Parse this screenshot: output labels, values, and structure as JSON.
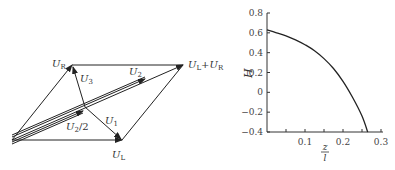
{
  "diagram": {
    "points": {
      "origin": [
        12,
        140
      ],
      "UR": [
        72,
        65
      ],
      "UL": [
        122,
        140
      ],
      "ULplusUR": [
        183,
        65
      ],
      "mid": [
        85,
        107
      ]
    },
    "labels": {
      "UR": {
        "main": "U",
        "sub": "R"
      },
      "UL": {
        "main": "U",
        "sub": "L"
      },
      "sum": {
        "main1": "U",
        "sub1": "L",
        "plus": "+",
        "main2": "U",
        "sub2": "R"
      },
      "U1": {
        "main": "U",
        "sub": "1"
      },
      "U2": {
        "main": "U",
        "sub": "2"
      },
      "U2half": {
        "main": "U",
        "sub": "2",
        "tail": "/2"
      },
      "U3": {
        "main": "U",
        "sub": "3"
      }
    },
    "line_color": "#222222"
  },
  "chart_data": {
    "type": "line",
    "title": "",
    "xlabel_num": "z",
    "xlabel_den": "l",
    "xlabel": "z/l",
    "ylabel": "H",
    "xlim": [
      0,
      0.3
    ],
    "ylim": [
      -0.4,
      0.8
    ],
    "x_ticks": [
      0.05,
      0.1,
      0.15,
      0.2,
      0.25,
      0.3
    ],
    "x_tick_labels": [
      "",
      "0.1",
      "",
      "0.2",
      "",
      "0.3"
    ],
    "y_ticks": [
      0.8,
      0.6,
      0.4,
      0.2,
      0,
      -0.2,
      -0.4
    ],
    "y_tick_labels": [
      "0.8",
      "0.6",
      "0.4",
      "0.2",
      "0",
      "−0.2",
      "−0.4"
    ],
    "grid": false,
    "series": [
      {
        "name": "H",
        "x": [
          0,
          0.025,
          0.05,
          0.075,
          0.1,
          0.125,
          0.15,
          0.175,
          0.2,
          0.225,
          0.25,
          0.265
        ],
        "y": [
          0.63,
          0.6,
          0.57,
          0.53,
          0.48,
          0.42,
          0.34,
          0.24,
          0.11,
          -0.05,
          -0.24,
          -0.4
        ]
      }
    ]
  }
}
